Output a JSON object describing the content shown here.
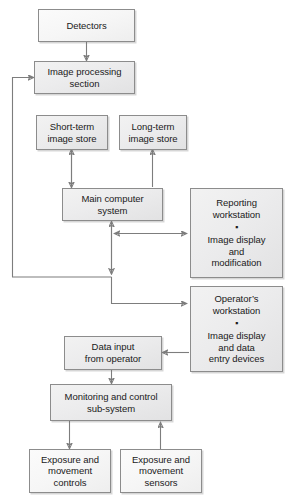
{
  "diagram": {
    "type": "flowchart",
    "background_color": "#ffffff",
    "box_fill_color": "#ececed",
    "box_border_color": "#8c8c8c",
    "connector_color": "#7d7d7d",
    "nodes": [
      {
        "id": "detectors",
        "label": "Detectors"
      },
      {
        "id": "image_processing",
        "label": "Image processing\nsection"
      },
      {
        "id": "short_term",
        "label": "Short-term\nimage store"
      },
      {
        "id": "long_term",
        "label": "Long-term\nimage store"
      },
      {
        "id": "main_computer",
        "label": "Main computer\nsystem"
      },
      {
        "id": "reporting_ws",
        "title": "Reporting\nworkstation",
        "bullet": "▪",
        "body": "Image display\nand\nmodification"
      },
      {
        "id": "operator_ws",
        "title": "Operator’s\nworkstation",
        "bullet": "▪",
        "body": "Image display\nand data\nentry devices"
      },
      {
        "id": "data_input",
        "label": "Data input\nfrom operator"
      },
      {
        "id": "monitoring",
        "label": "Monitoring and control\nsub-system"
      },
      {
        "id": "exposure_controls",
        "label": "Exposure and\nmovement\ncontrols"
      },
      {
        "id": "exposure_sensors",
        "label": "Exposure and\nmovement\nsensors"
      }
    ],
    "edges": [
      {
        "from": "detectors",
        "to": "image_processing",
        "direction": "one-way"
      },
      {
        "from": "main_computer",
        "to": "short_term",
        "direction": "two-way"
      },
      {
        "from": "main_computer",
        "to": "long_term",
        "direction": "one-way"
      },
      {
        "from": "main_computer",
        "to": "reporting_ws",
        "direction": "two-way"
      },
      {
        "from": "main_computer",
        "to": "operator_ws",
        "direction": "one-way"
      },
      {
        "from": "main_computer",
        "to": "image_processing",
        "direction": "one-way",
        "note": "feedback loop along left edge"
      },
      {
        "from": "operator_ws",
        "to": "data_input",
        "direction": "one-way"
      },
      {
        "from": "data_input",
        "to": "monitoring",
        "direction": "one-way"
      },
      {
        "from": "monitoring",
        "to": "exposure_controls",
        "direction": "one-way"
      },
      {
        "from": "exposure_sensors",
        "to": "monitoring",
        "direction": "one-way"
      }
    ]
  }
}
